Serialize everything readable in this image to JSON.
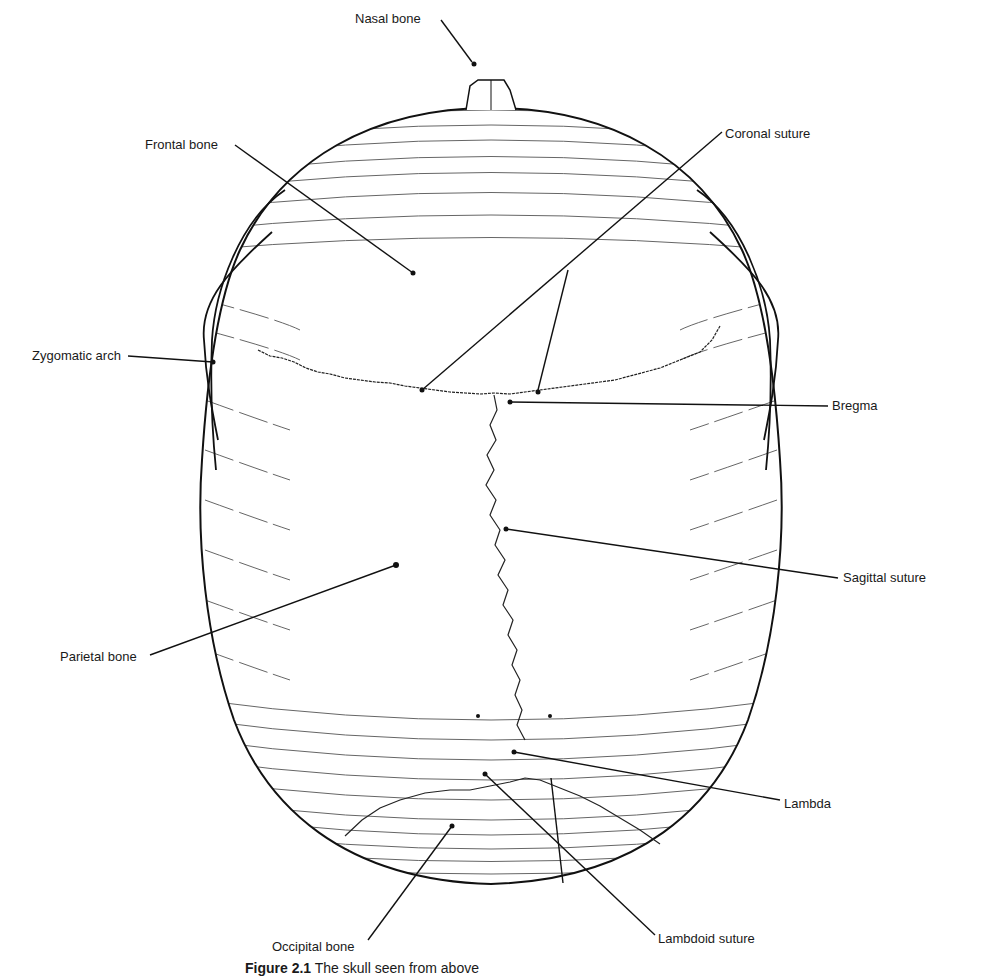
{
  "figure": {
    "caption_number": "Figure 2.1",
    "caption_text": "The skull seen from above"
  },
  "labels": [
    {
      "id": "nasal-bone",
      "text": "Nasal bone",
      "x": 355,
      "y": 12
    },
    {
      "id": "frontal-bone",
      "text": "Frontal bone",
      "x": 145,
      "y": 138
    },
    {
      "id": "coronal-suture",
      "text": "Coronal suture",
      "x": 725,
      "y": 127
    },
    {
      "id": "zygomatic-arch",
      "text": "Zygomatic arch",
      "x": 32,
      "y": 349
    },
    {
      "id": "bregma",
      "text": "Bregma",
      "x": 832,
      "y": 403
    },
    {
      "id": "sagittal-suture",
      "text": "Sagittal suture",
      "x": 843,
      "y": 574
    },
    {
      "id": "parietal-bone",
      "text": "Parietal bone",
      "x": 60,
      "y": 651
    },
    {
      "id": "lambda",
      "text": "Lambda",
      "x": 784,
      "y": 799
    },
    {
      "id": "lambdoid-suture",
      "text": "Lambdoid suture",
      "x": 658,
      "y": 932
    },
    {
      "id": "occipital-bone",
      "text": "Occipital bone",
      "x": 272,
      "y": 943
    }
  ]
}
